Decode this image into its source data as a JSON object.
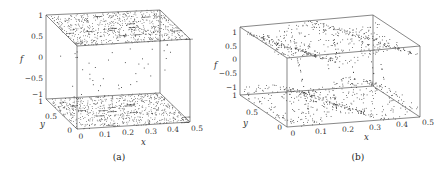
{
  "figure": {
    "panels": [
      {
        "caption": "(a)"
      },
      {
        "caption": "(b)"
      }
    ]
  },
  "chart_data": [
    {
      "type": "scatter",
      "subtype": "3d-scatter",
      "title": "",
      "caption": "(a)",
      "xlabel": "x",
      "ylabel": "y",
      "zlabel": "f",
      "xlim": [
        0,
        0.5
      ],
      "ylim": [
        0,
        1
      ],
      "zlim": [
        -1,
        1
      ],
      "xticks": [
        "0",
        "0.1",
        "0.2",
        "0.3",
        "0.4",
        "0.5"
      ],
      "yticks": [
        "0",
        "0.5",
        "1"
      ],
      "zticks": [
        "-1",
        "-0.5",
        "0",
        "0.5",
        "1"
      ],
      "grid": false,
      "legend": null,
      "description": "Dense uniform-looking point clouds on the f=1 top plane and f=-1 bottom plane with short dash-like clusters; sparse points in the interior arranged in faint vertical columns near x≈0.1, 0.2, 0.3, 0.4."
    },
    {
      "type": "scatter",
      "subtype": "3d-scatter",
      "title": "",
      "caption": "(b)",
      "xlabel": "x",
      "ylabel": "y",
      "zlabel": "f",
      "xlim": [
        0,
        0.5
      ],
      "ylim": [
        0,
        1
      ],
      "zlim": [
        -1,
        1
      ],
      "xticks": [
        "0",
        "0.1",
        "0.2",
        "0.3",
        "0.4",
        "0.5"
      ],
      "yticks": [
        "0",
        "0.5",
        "1"
      ],
      "zticks": [
        "-1",
        "-0.5",
        "0",
        "0.5",
        "1"
      ],
      "grid": false,
      "legend": null,
      "description": "Points concentrated in curved bands near f≈1 (upper) and f≈-1 (lower) spanning x, with sparse diagonal streaks of points in the interior."
    }
  ],
  "labels": {
    "x": "x",
    "y": "y",
    "f": "f",
    "xticks": [
      "0",
      "0.1",
      "0.2",
      "0.3",
      "0.4",
      "0.5"
    ],
    "yticks": [
      "0",
      "0.5",
      "1"
    ],
    "zticks": [
      "1",
      "0.5",
      "0",
      "-0.5",
      "-1"
    ]
  }
}
